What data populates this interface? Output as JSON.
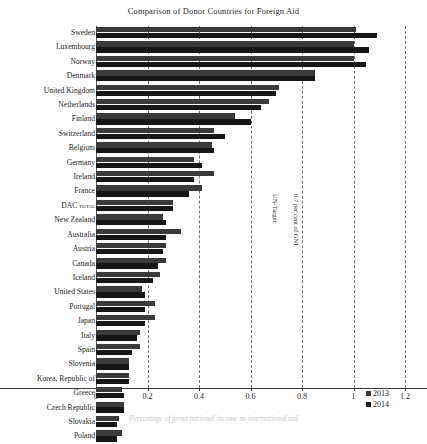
{
  "chart_data": {
    "type": "bar",
    "title": "Comparison of Donor Countries for Foreign Aid",
    "xlabel": "Percentage of gross national income as international aid",
    "ylabel": "",
    "xlim": [
      0,
      1.2
    ],
    "orientation": "horizontal",
    "grid": true,
    "legend_position": "bottom-right",
    "xticks": [
      "0",
      "0.2",
      "0.4",
      "0.6",
      "0.8",
      "1",
      "1.2"
    ],
    "xtick_values": [
      0,
      0.2,
      0.4,
      0.6,
      0.8,
      1.0,
      1.2
    ],
    "categories": [
      "Sweden",
      "Luxembourg",
      "Norway",
      "Denmark",
      "United Kingdom",
      "Netherlands",
      "Finland",
      "Switzerland",
      "Belgium",
      "Germany",
      "Ireland",
      "France",
      "DAC total",
      "New Zealand",
      "Australia",
      "Austria",
      "Canada",
      "Iceland",
      "United States",
      "Portugal",
      "Japan",
      "Italy",
      "Spain",
      "Slovenia",
      "Korea, Republic of",
      "Greece",
      "Czech Republic",
      "Slovakia",
      "Poland"
    ],
    "series": [
      {
        "name": "2013",
        "color": "#3a3a3a",
        "values": [
          1.01,
          1.0,
          1.0,
          0.85,
          0.71,
          0.67,
          0.54,
          0.46,
          0.45,
          0.38,
          0.46,
          0.41,
          0.3,
          0.26,
          0.33,
          0.27,
          0.27,
          0.25,
          0.18,
          0.23,
          0.23,
          0.17,
          0.17,
          0.13,
          0.13,
          0.1,
          0.11,
          0.09,
          0.1
        ]
      },
      {
        "name": "2014",
        "color": "#171717",
        "values": [
          1.09,
          1.06,
          1.05,
          0.85,
          0.7,
          0.64,
          0.6,
          0.5,
          0.46,
          0.41,
          0.38,
          0.36,
          0.3,
          0.27,
          0.27,
          0.26,
          0.24,
          0.22,
          0.19,
          0.19,
          0.19,
          0.16,
          0.14,
          0.13,
          0.13,
          0.11,
          0.11,
          0.08,
          0.08
        ]
      }
    ],
    "annotations": [
      {
        "text": "UN-Target:",
        "x": 0.7,
        "rotation": 90
      },
      {
        "text": "0.7 per cent of GNI",
        "x": 0.78,
        "rotation": 90
      }
    ]
  },
  "legend": {
    "items": [
      {
        "label": "2013"
      },
      {
        "label": "2014"
      }
    ]
  }
}
